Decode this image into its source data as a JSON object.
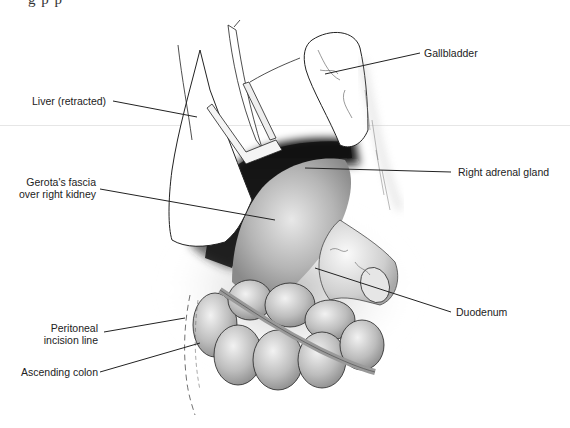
{
  "figure": {
    "cut_off_title_fragment": "g              p       p",
    "labels": {
      "liver": "Liver (retracted)",
      "gallbladder": "Gallbladder",
      "adrenal": "Right adrenal gland",
      "gerota_line1": "Gerota's fascia",
      "gerota_line2": "over right kidney",
      "duodenum": "Duodenum",
      "peritoneal_line1": "Peritoneal",
      "peritoneal_line2": "incision line",
      "colon": "Ascending colon"
    },
    "colors": {
      "ink": "#222222",
      "shadow": "#1a1a1a",
      "tissue": "#b8b8b8",
      "rule": "#e6e6e6"
    }
  }
}
